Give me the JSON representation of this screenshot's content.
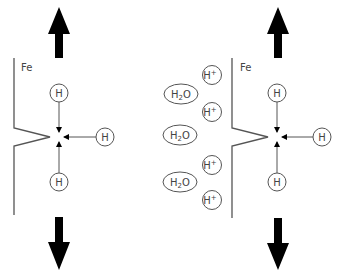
{
  "diagram": {
    "colors": {
      "arrow": "#000000",
      "line": "#555555",
      "text": "#444444",
      "background": "#ffffff"
    },
    "left_panel": {
      "metal_label": "Fe",
      "atoms": [
        {
          "label": "H",
          "position": "above-tip"
        },
        {
          "label": "H",
          "position": "right-of-tip"
        },
        {
          "label": "H",
          "position": "below-tip"
        }
      ],
      "stress_arrows": [
        "up",
        "down"
      ]
    },
    "right_panel": {
      "metal_label": "Fe",
      "environment": [
        {
          "label": "H+",
          "base": "H",
          "sup": "+"
        },
        {
          "label": "H2O",
          "base": "H",
          "sub": "2",
          "tail": "O"
        },
        {
          "label": "H+",
          "base": "H",
          "sup": "+"
        },
        {
          "label": "H2O",
          "base": "H",
          "sub": "2",
          "tail": "O"
        },
        {
          "label": "H+",
          "base": "H",
          "sup": "+"
        },
        {
          "label": "H2O",
          "base": "H",
          "sub": "2",
          "tail": "O"
        },
        {
          "label": "H+",
          "base": "H",
          "sup": "+"
        }
      ],
      "atoms": [
        {
          "label": "H",
          "position": "above-tip"
        },
        {
          "label": "H",
          "position": "right-of-tip"
        },
        {
          "label": "H",
          "position": "below-tip"
        }
      ],
      "stress_arrows": [
        "up",
        "down"
      ]
    }
  }
}
